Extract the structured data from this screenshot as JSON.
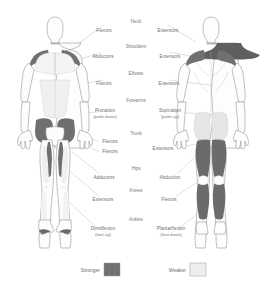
{
  "figures": [
    {
      "name": "anterior-view",
      "label": "Front view of human body"
    },
    {
      "name": "posterior-view",
      "label": "Back view of human body"
    }
  ],
  "colors": {
    "stronger": "#6f6f6f",
    "weaker": "#e3e3e3",
    "outline": "#8d8d8d",
    "text": "#6d6d6d",
    "leader": "#b8b8b8",
    "background": "#ffffff"
  },
  "groups": [
    {
      "name": "neck",
      "title": "Neck",
      "left": {
        "label": "Flexors",
        "sub": ""
      },
      "right": {
        "label": "Extensors",
        "sub": ""
      }
    },
    {
      "name": "shoulders",
      "title": "Shoulders",
      "left": {
        "label": "Abductors",
        "sub": ""
      },
      "right": {
        "label": "Extensors",
        "sub": ""
      }
    },
    {
      "name": "elbows",
      "title": "Elbows",
      "left": {
        "label": "Flexors",
        "sub": ""
      },
      "right": {
        "label": "Extensors",
        "sub": ""
      }
    },
    {
      "name": "forearms",
      "title": "Forearms",
      "left": {
        "label": "Pronation",
        "sub": "(palm down)"
      },
      "right": {
        "label": "Supination",
        "sub": "(palm up)"
      }
    },
    {
      "name": "trunk",
      "title": "Trunk",
      "left": {
        "label": "Flexors",
        "sub": "Flexors"
      },
      "right": {
        "label": "Extensors",
        "sub": ""
      }
    },
    {
      "name": "hips",
      "title": "Hips",
      "left": {
        "label": "Adductors",
        "sub": ""
      },
      "right": {
        "label": "Abduction",
        "sub": ""
      }
    },
    {
      "name": "knees",
      "title": "Knees",
      "left": {
        "label": "Extensors",
        "sub": ""
      },
      "right": {
        "label": "Flexors",
        "sub": ""
      }
    },
    {
      "name": "ankles",
      "title": "Ankles",
      "left": {
        "label": "Dorsiflexion",
        "sub": "(foot up)"
      },
      "right": {
        "label": "Plantarflexion",
        "sub": "(foot down)"
      }
    }
  ],
  "legend": {
    "items": [
      {
        "name": "stronger",
        "label": "Stronger",
        "color": "#6f6f6f"
      },
      {
        "name": "weaker",
        "label": "Weaker",
        "color": "#e9e9e9"
      }
    ]
  }
}
